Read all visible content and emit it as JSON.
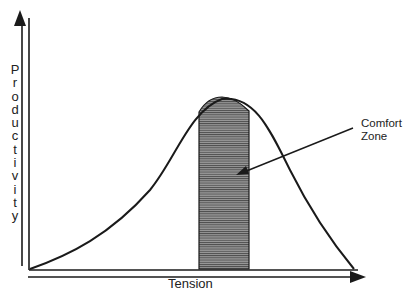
{
  "chart_data": {
    "type": "diagram",
    "title": "",
    "xlabel": "Tension",
    "ylabel": "Productivity",
    "curve": "bell",
    "shaded_region": {
      "label": "Comfort Zone",
      "x_start_fraction": 0.52,
      "x_end_fraction": 0.68
    },
    "annotations": [
      {
        "text": "Comfort Zone",
        "points_to": "shaded_region"
      }
    ],
    "grid": false,
    "ticks": false
  },
  "labels": {
    "y_axis": "Productivity",
    "x_axis": "Tension",
    "annotation_line1": "Comfort",
    "annotation_line2": "Zone"
  },
  "colors": {
    "line": "#1a1a1a",
    "shade": "#7a7a7a",
    "background": "#ffffff"
  }
}
